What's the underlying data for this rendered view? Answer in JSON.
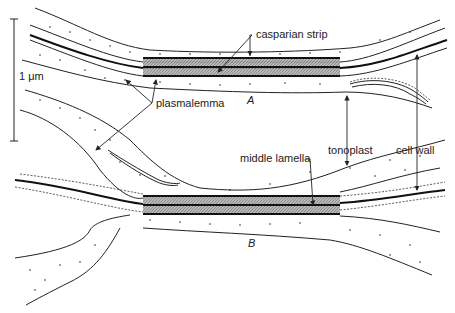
{
  "figure": {
    "type": "diagram",
    "colors": {
      "line": "#222222",
      "hatch": "#9a9a9a",
      "background": "#ffffff"
    }
  },
  "scale_bar": {
    "label": "1 μm"
  },
  "labels": {
    "casparian_strip": "casparian strip",
    "plasmalemma": "plasmalemma",
    "tonoplast": "tonoplast",
    "cell_wall": "cell wall",
    "middle_lamella": "middle lamella",
    "panel_a": "A",
    "panel_b": "B"
  }
}
